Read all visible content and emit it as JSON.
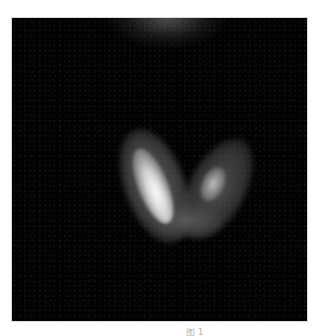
{
  "figure": {
    "background_color": "#020202",
    "regions": {
      "top_glow": "diffuse faint activity at top center",
      "left_lobe": "bright, high-uptake elongated lobe",
      "right_lobe": "moderate-uptake elongated lobe",
      "isthmus": "lower connecting region"
    }
  },
  "caption": {
    "text": "图 1"
  }
}
